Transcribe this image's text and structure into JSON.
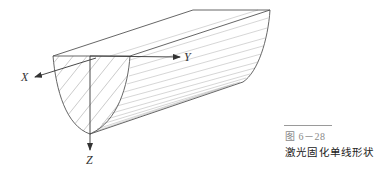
{
  "figure": {
    "axes": {
      "x_label": "X",
      "y_label": "Y",
      "z_label": "Z"
    },
    "caption": {
      "number": "图 6－28",
      "title": "激光固化单线形状"
    },
    "colors": {
      "outline": "#555555",
      "hatch": "#bbbbbb",
      "axis": "#333333"
    }
  }
}
